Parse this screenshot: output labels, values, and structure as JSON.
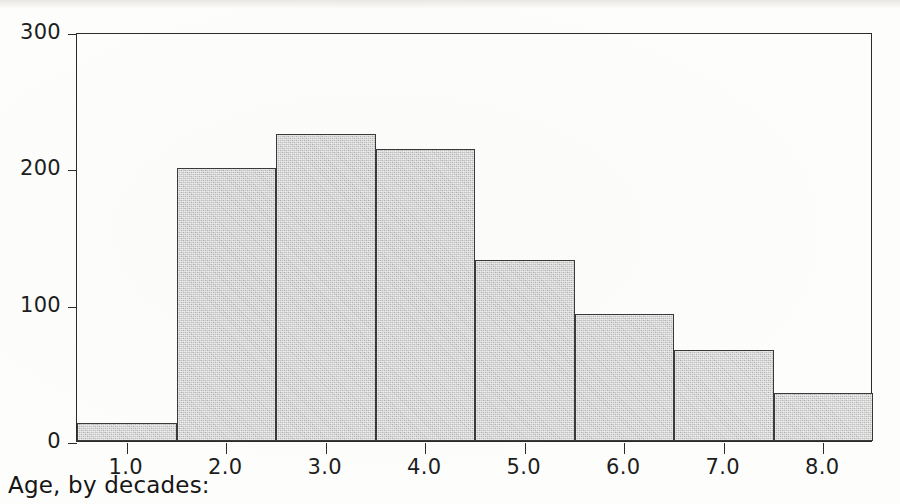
{
  "page": {
    "background_color": "#fdfdfb",
    "ink_color": "#1d1d1d"
  },
  "caption": {
    "text": "Age, by decades:"
  },
  "axes": {
    "y_ticks": [
      "0",
      "100",
      "200",
      "300"
    ],
    "x_ticks": [
      "1.0",
      "2.0",
      "3.0",
      "4.0",
      "5.0",
      "6.0",
      "7.0",
      "8.0"
    ]
  },
  "style": {
    "bar_fill": "#c2c2c2",
    "bar_outline": "#3a3a3a",
    "frame_color": "#2b2b2b"
  },
  "chart_data": {
    "type": "bar",
    "title": "",
    "subtitle": "",
    "xlabel": "Age, by decades:",
    "ylabel": "",
    "categories": [
      "1.0",
      "2.0",
      "3.0",
      "4.0",
      "5.0",
      "6.0",
      "7.0",
      "8.0"
    ],
    "values": [
      13,
      200,
      225,
      214,
      133,
      93,
      67,
      35
    ],
    "bin_edges": [
      0.5,
      1.5,
      2.5,
      3.5,
      4.5,
      5.5,
      6.5,
      7.5,
      8.5
    ],
    "xlim": [
      0.5,
      8.5
    ],
    "ylim": [
      0,
      300
    ],
    "y_tick_values": [
      0,
      100,
      200,
      300
    ],
    "x_tick_values": [
      1.0,
      2.0,
      3.0,
      4.0,
      5.0,
      6.0,
      7.0,
      8.0
    ],
    "grid": false,
    "legend": null,
    "legend_position": "none",
    "annotations": []
  }
}
